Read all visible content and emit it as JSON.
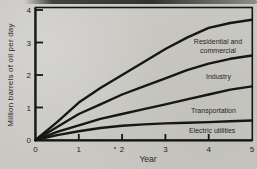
{
  "figure": {
    "y_axis_title": "Million barrels of oil per day",
    "x_axis_title": "Year"
  },
  "chart_data": {
    "type": "line",
    "title": "",
    "xlabel": "Year",
    "ylabel": "Million barrels of oil per day",
    "xlim": [
      0,
      5
    ],
    "ylim": [
      0,
      4
    ],
    "x_ticks": [
      0,
      1,
      2,
      3,
      4,
      5
    ],
    "y_ticks": [
      0,
      1,
      2,
      3,
      4
    ],
    "grid": false,
    "legend": "inline-labels",
    "x": [
      0,
      0.5,
      1,
      1.5,
      2,
      2.5,
      3,
      3.5,
      4,
      4.5,
      5
    ],
    "series": [
      {
        "name": "Residential and commercial",
        "values": [
          0,
          0.55,
          1.15,
          1.6,
          2.0,
          2.4,
          2.8,
          3.15,
          3.45,
          3.6,
          3.7
        ]
      },
      {
        "name": "Industry",
        "values": [
          0,
          0.4,
          0.8,
          1.1,
          1.4,
          1.65,
          1.9,
          2.15,
          2.35,
          2.5,
          2.6
        ]
      },
      {
        "name": "Transportation",
        "values": [
          0,
          0.25,
          0.45,
          0.65,
          0.8,
          0.95,
          1.1,
          1.25,
          1.4,
          1.55,
          1.65
        ]
      },
      {
        "name": "Electric utilities",
        "values": [
          0,
          0.15,
          0.27,
          0.37,
          0.44,
          0.48,
          0.51,
          0.53,
          0.55,
          0.58,
          0.6
        ]
      }
    ],
    "colors": {
      "line": "#161615",
      "background": "#c9c8c3",
      "text": "#24241f"
    }
  }
}
